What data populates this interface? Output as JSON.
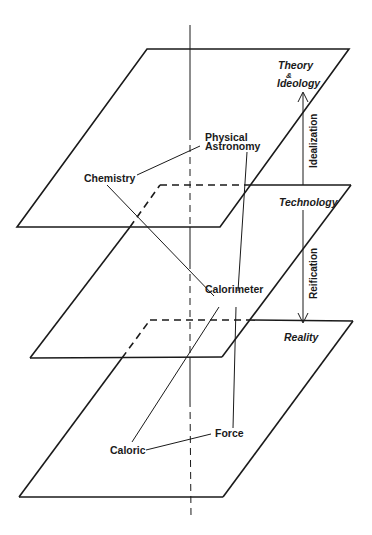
{
  "diagram": {
    "levels": {
      "top": "Theory",
      "top_amp": "&",
      "top2": "Ideology",
      "middle": "Technology",
      "bottom": "Reality"
    },
    "processes": {
      "up": "Idealization",
      "down": "Reification"
    },
    "concepts": {
      "physical": "Physical",
      "astronomy": "Astronomy",
      "chemistry": "Chemistry",
      "calorimeter": "Calorimeter",
      "caloric": "Caloric",
      "force": "Force"
    },
    "colors": {
      "ink": "#1a1a1a",
      "background": "#ffffff"
    }
  }
}
